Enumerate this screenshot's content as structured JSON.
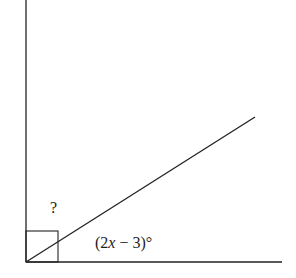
{
  "diagram": {
    "type": "angle-diagram",
    "labels": {
      "unknown_angle": "?",
      "known_angle_prefix": "(2",
      "known_angle_var": "x",
      "known_angle_suffix": " − 3)°"
    },
    "right_angle_marker": true,
    "colors": {
      "stroke": "#222222",
      "background": "#ffffff"
    },
    "geometry": {
      "vertex": [
        26,
        262
      ],
      "vertical_ray_end": [
        26,
        0
      ],
      "horizontal_ray_end": [
        282,
        262
      ],
      "diagonal_ray_end": [
        255,
        117
      ],
      "square_size": 32
    }
  }
}
